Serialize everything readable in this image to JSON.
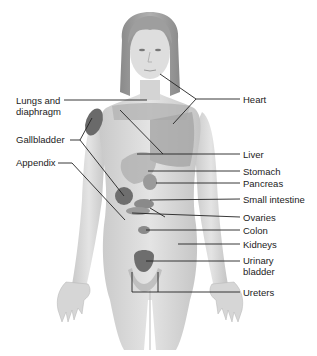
{
  "diagram": {
    "type": "anatomical referred-pain map",
    "colors": {
      "background": "#ffffff",
      "skin_light": "#dcdcdc",
      "skin_mid": "#c8c8c8",
      "region_medium": "#a8a8a8",
      "region_dark": "#6e6e6e",
      "hair": "#9a9a9a",
      "leader_line": "#222222"
    },
    "labels_left": [
      {
        "id": "lungs",
        "line1": "Lungs and",
        "line2": "diaphragm"
      },
      {
        "id": "gallbladder",
        "text": "Gallbladder"
      },
      {
        "id": "appendix",
        "text": "Appendix"
      }
    ],
    "labels_right": [
      {
        "id": "heart",
        "text": "Heart"
      },
      {
        "id": "liver",
        "text": "Liver"
      },
      {
        "id": "stomach",
        "text": "Stomach"
      },
      {
        "id": "pancreas",
        "text": "Pancreas"
      },
      {
        "id": "small_intestine",
        "text": "Small intestine"
      },
      {
        "id": "ovaries",
        "text": "Ovaries"
      },
      {
        "id": "colon",
        "text": "Colon"
      },
      {
        "id": "kidneys",
        "text": "Kidneys"
      },
      {
        "id": "urinary_bladder",
        "line1": "Urinary",
        "line2": "bladder"
      },
      {
        "id": "ureters",
        "text": "Ureters"
      }
    ]
  }
}
